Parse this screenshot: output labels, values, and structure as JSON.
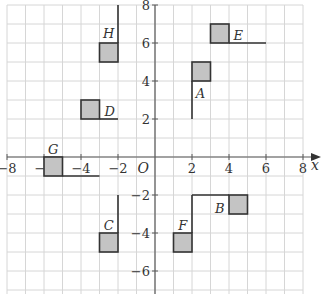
{
  "figure": {
    "x_axis": {
      "min": -8,
      "max": 8,
      "label": "x",
      "ticks": [
        -8,
        -6,
        -4,
        -2,
        2,
        4,
        6,
        8
      ],
      "tick_labels": [
        "−8",
        "−6",
        "−4",
        "−2",
        "2",
        "4",
        "6",
        "8"
      ]
    },
    "y_axis": {
      "min": -7,
      "max": 8,
      "ticks": [
        8,
        6,
        4,
        2,
        -2,
        -4,
        -6
      ],
      "tick_labels": [
        "8",
        "6",
        "4",
        "2",
        "−2",
        "−4",
        "−6"
      ]
    },
    "origin_label": "O",
    "grid": true,
    "colors": {
      "square_fill": "#c4c4c4",
      "outline": "#333333",
      "grid": "#d6d6d6",
      "axis": "#5a5a5a"
    },
    "shapes": [
      {
        "label": "H",
        "square": [
          -3,
          5
        ],
        "line": [
          [
            -2,
            6
          ],
          [
            -2,
            8
          ]
        ],
        "label_pos": [
          -2.5,
          6.55
        ]
      },
      {
        "label": "D",
        "square": [
          -4,
          2
        ],
        "line": [
          [
            -3,
            2
          ],
          [
            -2,
            2
          ]
        ],
        "label_pos": [
          -2.45,
          2.4
        ]
      },
      {
        "label": "G",
        "square": [
          -6,
          -1
        ],
        "line": [
          [
            -5,
            -1
          ],
          [
            -3,
            -1
          ]
        ],
        "label_pos": [
          -5.5,
          0.4
        ]
      },
      {
        "label": "C",
        "square": [
          -3,
          -5
        ],
        "line": [
          [
            -2,
            -4
          ],
          [
            -2,
            -2
          ]
        ],
        "label_pos": [
          -2.5,
          -3.6
        ]
      },
      {
        "label": "A",
        "square": [
          2,
          4
        ],
        "line": [
          [
            2,
            4
          ],
          [
            2,
            2
          ]
        ],
        "label_pos": [
          2.45,
          3.35
        ]
      },
      {
        "label": "E",
        "square": [
          3,
          6
        ],
        "line": [
          [
            4,
            6
          ],
          [
            6,
            6
          ]
        ],
        "label_pos": [
          4.5,
          6.4
        ]
      },
      {
        "label": "B",
        "square": [
          4,
          -3
        ],
        "line": [
          [
            4,
            -2
          ],
          [
            2,
            -2
          ]
        ],
        "label_pos": [
          3.5,
          -2.7
        ]
      },
      {
        "label": "F",
        "square": [
          1,
          -5
        ],
        "line": [
          [
            2,
            -4
          ],
          [
            2,
            -2
          ]
        ],
        "label_pos": [
          1.5,
          -3.6
        ]
      }
    ]
  }
}
